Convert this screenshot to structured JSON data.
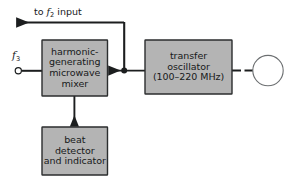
{
  "diagram": {
    "background_color": "#ffffff",
    "box_fill_color": "#b4b4b4",
    "box_border_color": "#2b2d2e",
    "line_color": "#1c1e1f",
    "blocks": [
      {
        "id": "mixer",
        "name": "harmonic-generating-microwave-mixer",
        "lines": [
          "harmonic-",
          "generating",
          "microwave",
          "mixer"
        ]
      },
      {
        "id": "oscillator",
        "name": "transfer-oscillator",
        "lines": [
          "transfer",
          "oscillator",
          "(100–220 MHz)"
        ]
      },
      {
        "id": "beat_detector",
        "name": "beat-detector-and-indicator",
        "lines": [
          "beat",
          "detector",
          "and indicator"
        ]
      }
    ],
    "labels": {
      "output_to_f2": {
        "prefix": "to ",
        "symbol": "f",
        "subscript": "2",
        "suffix": " input"
      },
      "input_f3": {
        "symbol": "f",
        "subscript": "3"
      }
    },
    "connectors": {
      "f3_terminal": "open-circle-terminal",
      "oscillator_output": "open-circle-terminal",
      "branch_junction": "solid-junction-dot"
    }
  }
}
